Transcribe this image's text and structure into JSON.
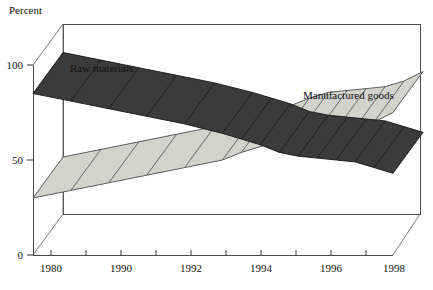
{
  "chart_data": {
    "type": "area",
    "title": "",
    "subtitle": "",
    "ylabel": "Percent",
    "xlabel": "",
    "ylim": [
      0,
      100
    ],
    "yticks": [
      0,
      50,
      100
    ],
    "ytick_labels": [
      "0",
      "50",
      "100"
    ],
    "xlim": [
      1980,
      1999
    ],
    "xticks": [
      1980,
      1990,
      1992,
      1994,
      1996,
      1998
    ],
    "xtick_labels": [
      "1980",
      "1990",
      "1992",
      "1994",
      "1996",
      "1998"
    ],
    "grid": false,
    "legend_position": "inline-annotations",
    "projection": "3d-ribbon",
    "x": [
      1980,
      1982,
      1984,
      1986,
      1988,
      1990,
      1991,
      1992,
      1993,
      1994,
      1995,
      1996,
      1997,
      1998,
      1999
    ],
    "series": [
      {
        "name": "Raw materials",
        "color": "#3b3b3b",
        "edge_color": "#151515",
        "values": [
          85,
          81,
          77,
          73,
          69,
          64,
          61,
          58,
          54,
          52,
          51,
          50,
          49,
          46,
          43
        ]
      },
      {
        "name": "Manufactured goods",
        "color": "#d3d3ce",
        "edge_color": "#4a4a4a",
        "values": [
          30,
          34,
          38,
          42,
          46,
          50,
          54,
          57,
          61,
          64,
          65,
          66,
          67,
          70,
          75
        ]
      }
    ],
    "annotations": [
      {
        "text": "Raw materials",
        "x_px": 70,
        "y_px": 70
      },
      {
        "text": "Manufactured goods",
        "x_px": 303,
        "y_px": 97
      }
    ]
  },
  "axes": {
    "y_axis_label": "Percent",
    "y_tick_0": "0",
    "y_tick_50": "50",
    "y_tick_100": "100",
    "x_tick_1": "1980",
    "x_tick_2": "1990",
    "x_tick_3": "1992",
    "x_tick_4": "1994",
    "x_tick_5": "1996",
    "x_tick_6": "1998"
  },
  "series_labels": {
    "raw_materials": "Raw materials",
    "manufactured_goods": "Manufactured goods"
  },
  "colors": {
    "dark_band": "#3b3b3b",
    "light_band": "#d3d3ce",
    "frame": "#4a4a4a",
    "text": "#111111",
    "background": "#ffffff"
  }
}
